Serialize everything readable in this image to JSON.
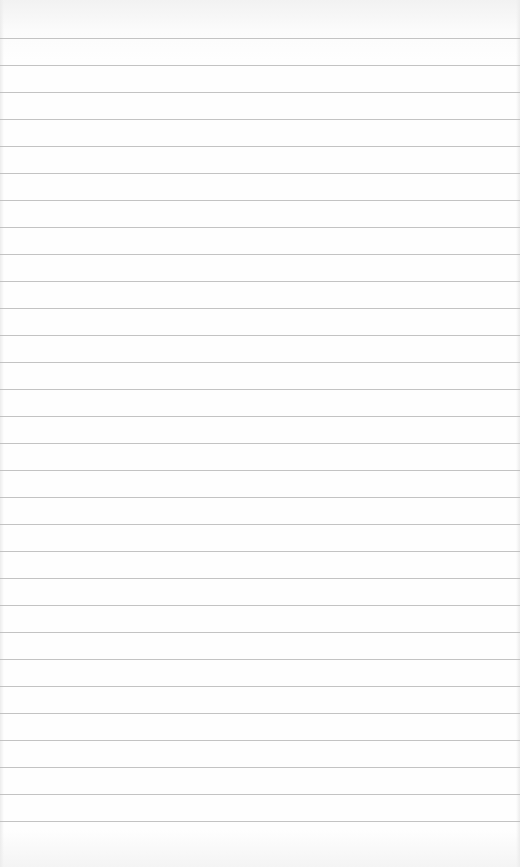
{
  "page": {
    "type": "lined-paper",
    "background_color": "#fdfdfd",
    "rule_color": "#b9b9b9",
    "rule_count": 30,
    "first_rule_y": 38,
    "rule_spacing_px": 27
  }
}
